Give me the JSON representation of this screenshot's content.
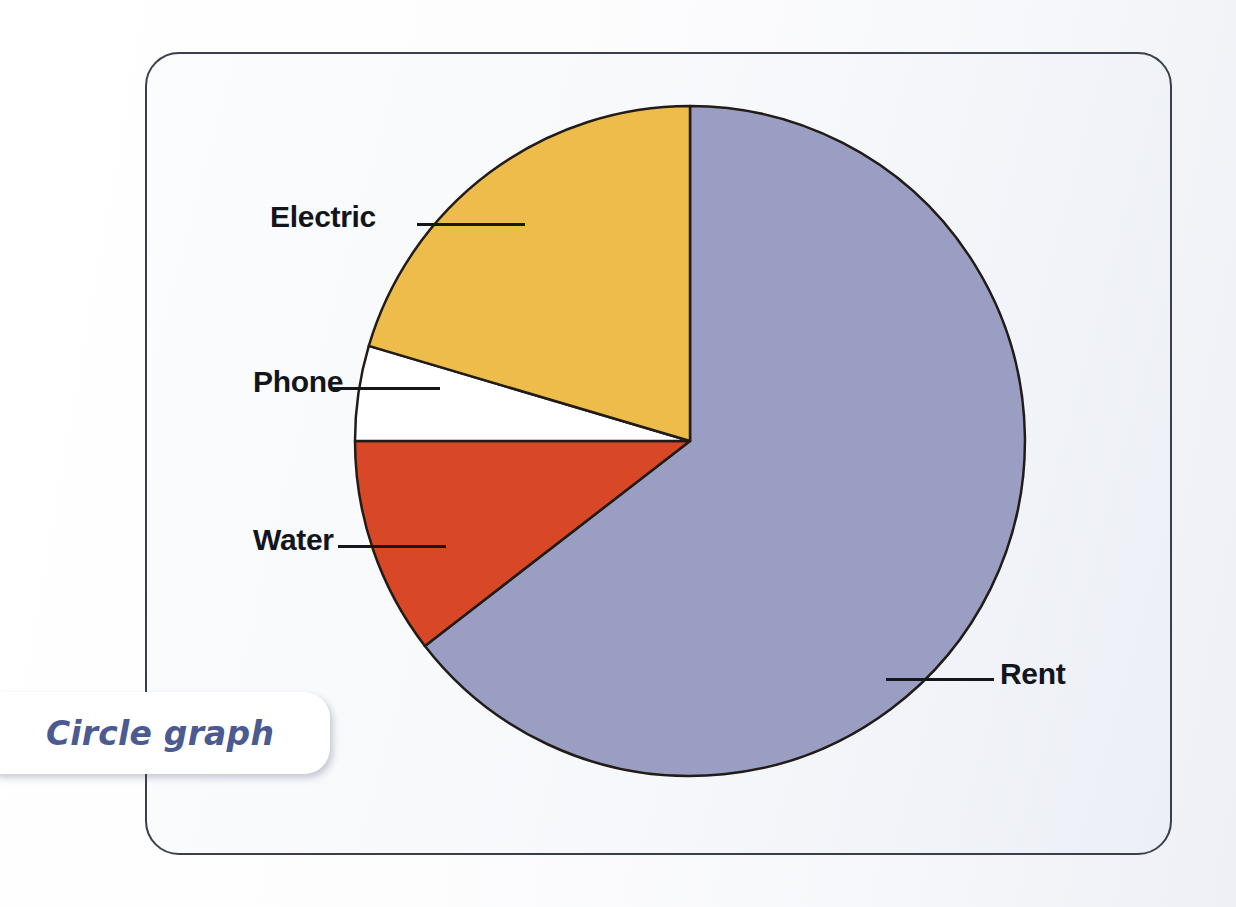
{
  "page": {
    "background_color": "#ffffff",
    "card_border_color": "#3a3f4c",
    "card_background_color": "#f4f6fa"
  },
  "badge": {
    "label": "Circle graph",
    "text_color": "#4b5b92",
    "background_color": "#ffffff"
  },
  "chart_data": {
    "type": "pie",
    "title": "Circle graph",
    "xlabel": "",
    "ylabel": "",
    "legend_position": "none",
    "grid": false,
    "labels": [
      "Rent",
      "Electric",
      "Phone",
      "Water"
    ],
    "values": [
      64.5,
      20.5,
      5.5,
      9.5
    ],
    "colors": [
      "#9a9ec2",
      "#edbc4a",
      "#ffffff",
      "#d94826"
    ],
    "start_angle_deg": 0,
    "direction": "counterclockwise",
    "slice_outline_color": "#221c18",
    "slices": [
      {
        "name": "Rent",
        "label": "Rent",
        "percent": 64.5,
        "color": "#9a9ec2",
        "start_deg": 0,
        "end_deg": 232.3,
        "label_side": "right"
      },
      {
        "name": "Electric",
        "label": "Electric",
        "percent": 20.5,
        "color": "#edbc4a",
        "start_deg": 286.5,
        "end_deg": 360,
        "label_side": "left"
      },
      {
        "name": "Phone",
        "label": "Phone",
        "percent": 5.5,
        "color": "#ffffff",
        "start_deg": 270,
        "end_deg": 286.5,
        "label_side": "left"
      },
      {
        "name": "Water",
        "label": "Water",
        "percent": 9.5,
        "color": "#d94826",
        "start_deg": 232.3,
        "end_deg": 270,
        "label_side": "left"
      }
    ],
    "geometry": {
      "center_x": 690,
      "center_y": 441,
      "radius": 335
    }
  },
  "labels": {
    "electric": "Electric",
    "phone": "Phone",
    "water": "Water",
    "rent": "Rent"
  }
}
